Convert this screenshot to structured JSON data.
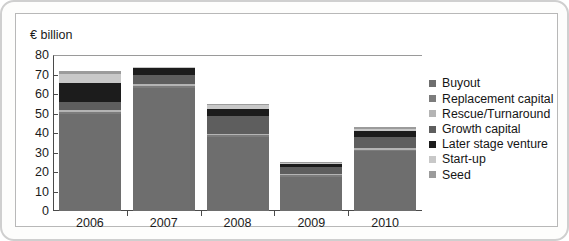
{
  "figure": {
    "y_axis_unit_label": "€ billion"
  },
  "chart_data": {
    "type": "bar",
    "stacked": true,
    "title": "",
    "subtitle": "",
    "xlabel": "",
    "ylabel": "€ billion",
    "ylim": [
      0,
      80
    ],
    "ytick_labels": [
      "80",
      "70",
      "60",
      "50",
      "40",
      "30",
      "20",
      "10",
      "0"
    ],
    "yticks": [
      80,
      70,
      60,
      50,
      40,
      30,
      20,
      10,
      0
    ],
    "grid": false,
    "legend_position": "right",
    "categories": [
      "2006",
      "2007",
      "2008",
      "2009",
      "2010"
    ],
    "series": [
      {
        "name": "Buyout",
        "color": "#6e6e6e",
        "values": [
          49.5,
          63.0,
          38.0,
          17.5,
          30.5
        ]
      },
      {
        "name": "Replacement capital",
        "color": "#7c7c7c",
        "values": [
          1.5,
          1.2,
          1.0,
          0.8,
          1.0
        ]
      },
      {
        "name": "Rescue/Turnaround",
        "color": "#b4b4b4",
        "values": [
          0.8,
          0.8,
          0.6,
          0.5,
          0.6
        ]
      },
      {
        "name": "Growth capital",
        "color": "#5e5e5e",
        "values": [
          4.2,
          4.5,
          9.0,
          3.5,
          6.0
        ]
      },
      {
        "name": "Later stage venture",
        "color": "#1c1c1c",
        "values": [
          9.5,
          3.8,
          3.6,
          1.8,
          2.9
        ]
      },
      {
        "name": "Start-up",
        "color": "#c8c8c8",
        "values": [
          5.0,
          0.5,
          2.0,
          0.6,
          1.2
        ]
      },
      {
        "name": "Seed",
        "color": "#9b9b9b",
        "values": [
          1.5,
          0.2,
          0.8,
          0.3,
          0.8
        ]
      }
    ],
    "totals": [
      72,
      74,
      55,
      25,
      43
    ]
  },
  "legend": {
    "items": [
      {
        "label": "Buyout",
        "color": "#6e6e6e"
      },
      {
        "label": "Replacement capital",
        "color": "#7c7c7c"
      },
      {
        "label": "Rescue/Turnaround",
        "color": "#b4b4b4"
      },
      {
        "label": "Growth capital",
        "color": "#5e5e5e"
      },
      {
        "label": "Later stage venture",
        "color": "#1c1c1c"
      },
      {
        "label": "Start-up",
        "color": "#c8c8c8"
      },
      {
        "label": "Seed",
        "color": "#9b9b9b"
      }
    ]
  }
}
